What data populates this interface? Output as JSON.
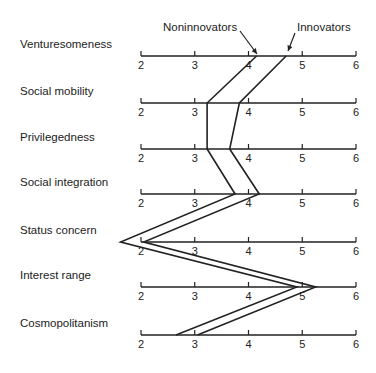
{
  "chart_data": {
    "type": "line",
    "title": "",
    "xlabel": "",
    "ylabel": "",
    "xlim": [
      2,
      6
    ],
    "tick_labels": [
      "2",
      "3",
      "4",
      "5",
      "6"
    ],
    "categories": [
      "Venturesomeness",
      "Social mobility",
      "Privilegedness",
      "Social integration",
      "Status concern",
      "Interest range",
      "Cosmopolitanism"
    ],
    "series": [
      {
        "name": "Noninnovators",
        "values": [
          4.15,
          3.23,
          3.23,
          3.75,
          1.62,
          4.9,
          2.65
        ]
      },
      {
        "name": "Innovators",
        "values": [
          4.7,
          3.83,
          3.65,
          4.2,
          2.05,
          5.25,
          3.05
        ]
      }
    ],
    "legend": [
      "Noninnovators",
      "Innovators"
    ],
    "legend_position": "top, with arrows pointing to first axis",
    "grid": false
  },
  "rows": [
    {
      "label": "Venturesomeness"
    },
    {
      "label": "Social mobility"
    },
    {
      "label": "Privilegedness"
    },
    {
      "label": "Social integration"
    },
    {
      "label": "Status concern"
    },
    {
      "label": "Interest range"
    },
    {
      "label": "Cosmopolitanism"
    }
  ],
  "ticks": [
    "2",
    "3",
    "4",
    "5",
    "6"
  ],
  "legend": {
    "noninnovators": "Noninnovators",
    "innovators": "Innovators"
  }
}
